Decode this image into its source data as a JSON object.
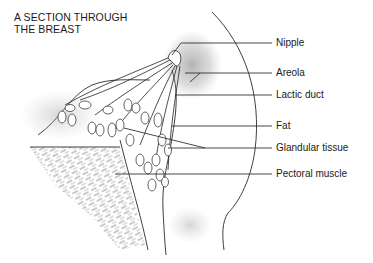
{
  "title": {
    "line1": "A SECTION THROUGH",
    "line2": "THE BREAST"
  },
  "labels": [
    {
      "id": "nipple",
      "text": "Nipple",
      "y": 43
    },
    {
      "id": "areola",
      "text": "Areola",
      "y": 73
    },
    {
      "id": "lactic-duct",
      "text": "Lactic duct",
      "y": 95
    },
    {
      "id": "fat",
      "text": "Fat",
      "y": 126
    },
    {
      "id": "glandular-tissue",
      "text": "Glandular tissue",
      "y": 148
    },
    {
      "id": "pectoral-muscle",
      "text": "Pectoral muscle",
      "y": 174
    }
  ],
  "colors": {
    "ink": "#1a1a1a",
    "background": "#ffffff"
  }
}
